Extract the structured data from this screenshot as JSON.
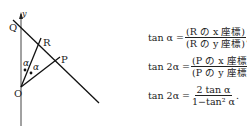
{
  "diagram": {
    "labels": {
      "y": "y",
      "Q": "Q",
      "R": "R",
      "P": "P",
      "O": "O",
      "alpha1": "α",
      "alpha2": "α"
    }
  },
  "equations": [
    {
      "lhs": "tan α =",
      "num": "(R の x 座標)",
      "den": "(R の y 座標)",
      "end": ","
    },
    {
      "lhs": "tan 2α =",
      "num": "(P の x 座標)",
      "den": "(P の y 座標)",
      "end": ","
    },
    {
      "lhs": "tan 2α =",
      "num": "2 tan α",
      "den": "1−tan² α",
      "end": "."
    }
  ]
}
